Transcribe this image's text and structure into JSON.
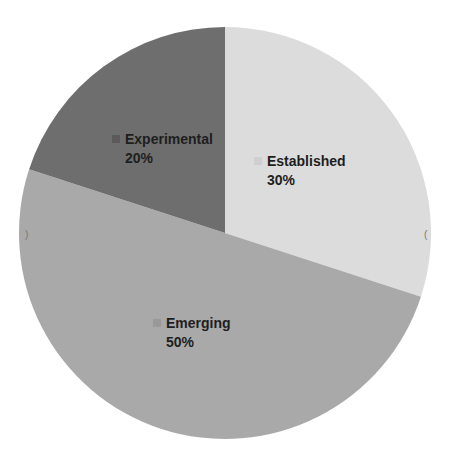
{
  "chart_data": {
    "type": "pie",
    "title": "",
    "categories": [
      "Established",
      "Emerging",
      "Experimental"
    ],
    "values": [
      30,
      50,
      20
    ],
    "labels": [
      "30%",
      "50%",
      "20%"
    ],
    "colors": [
      "#dcdcdc",
      "#a9a9a9",
      "#6e6e6e"
    ],
    "start_angle_deg": 0,
    "direction": "clockwise",
    "legend": "none (inline slice labels)",
    "center": [
      225,
      233
    ],
    "radius": 206
  },
  "slices": [
    {
      "name": "Established",
      "pct": "30%",
      "color": "#dcdcdc",
      "swatch": "#cfcfcf"
    },
    {
      "name": "Emerging",
      "pct": "50%",
      "color": "#a9a9a9",
      "swatch": "#999999"
    },
    {
      "name": "Experimental",
      "pct": "20%",
      "color": "#6e6e6e",
      "swatch": "#5a5a5a"
    }
  ],
  "edge_marks": {
    "left": ")",
    "right": "("
  }
}
